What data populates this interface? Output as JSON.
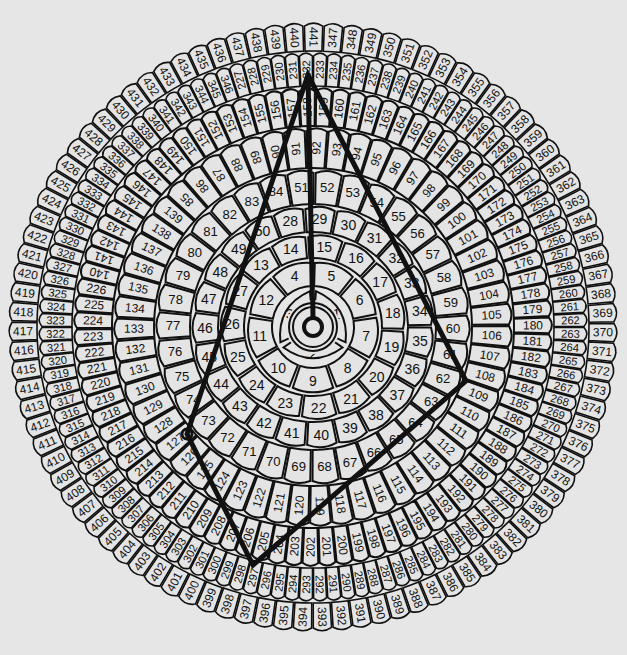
{
  "diagram": {
    "title": "",
    "center": [
      313,
      327
    ],
    "background": "#e6e6e6",
    "cell_fill": "#e4e4e4",
    "stroke": "#111111",
    "total_cells": 441,
    "rings": [
      {
        "from": 1,
        "to": 3,
        "r_in": 14,
        "r_out": 40,
        "start_deg": 0
      },
      {
        "from": 4,
        "to": 12,
        "r_in": 40,
        "r_out": 68,
        "start_deg": -40
      },
      {
        "from": 13,
        "to": 27,
        "r_in": 68,
        "r_out": 94,
        "start_deg": -52
      },
      {
        "from": 28,
        "to": 50,
        "r_in": 94,
        "r_out": 122,
        "start_deg": -20
      },
      {
        "from": 51,
        "to": 84,
        "r_in": 122,
        "r_out": 158,
        "start_deg": -10
      },
      {
        "from": 85,
        "to": 139,
        "r_in": 158,
        "r_out": 200,
        "start_deg": -48
      },
      {
        "from": 140,
        "to": 226,
        "r_in": 200,
        "r_out": 240,
        "start_deg": -78
      },
      {
        "from": 227,
        "to": 346,
        "r_in": 240,
        "r_out": 275,
        "start_deg": -18
      },
      {
        "from": 347,
        "to": 441,
        "r_in": 275,
        "r_out": 305,
        "start_deg": 2
      }
    ],
    "center_target": {
      "inner_r": 9,
      "ring1_r": 20,
      "ring2_r": 24
    },
    "pointer_line": {
      "from": [
        313,
        327
      ],
      "to": [
        308,
        75
      ]
    },
    "polygon": {
      "label": "quadrilateral overlay",
      "vertices": [
        [
          308,
          75
        ],
        [
          466,
          381
        ],
        [
          253,
          565
        ],
        [
          187,
          434
        ]
      ],
      "vertex_cells": [
        "210",
        "98",
        "264",
        "116"
      ],
      "stroke_width": 5
    }
  }
}
